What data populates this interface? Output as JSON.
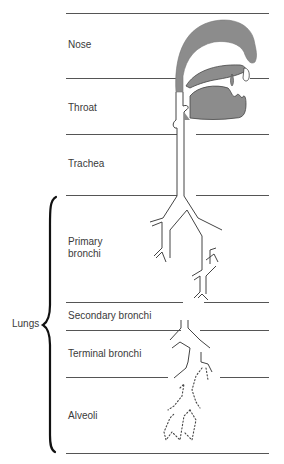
{
  "diagram": {
    "regions": [
      {
        "id": "nose",
        "label": "Nose"
      },
      {
        "id": "throat",
        "label": "Throat"
      },
      {
        "id": "trachea",
        "label": "Trachea"
      },
      {
        "id": "primary-bronchi",
        "label_line1": "Primary",
        "label_line2": "bronchi"
      },
      {
        "id": "secondary-bronchi",
        "label": "Secondary bronchi"
      },
      {
        "id": "terminal-bronchi",
        "label": "Terminal bronchi"
      },
      {
        "id": "alveoli",
        "label": "Alveoli"
      }
    ],
    "group": {
      "label": "Lungs",
      "spans": [
        "Primary bronchi",
        "Secondary bronchi",
        "Terminal bronchi",
        "Alveoli"
      ]
    },
    "colors": {
      "fill": "#8a8a8a",
      "line": "#444444"
    }
  }
}
